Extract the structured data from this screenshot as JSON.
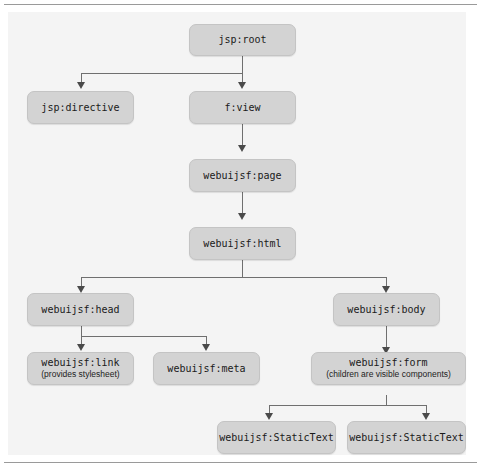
{
  "figure": {
    "kind": "component-tree-diagram",
    "panel_background": "#f4f4f4",
    "node_fill": "#d3d3d3",
    "node_border": "#c4c4c4",
    "connector_color": "#6f6f6f",
    "arrow_color": "#4a4a4a"
  },
  "nodes": {
    "root": {
      "label": "jsp:root"
    },
    "directive": {
      "label": "jsp:directive"
    },
    "view": {
      "label": "f:view"
    },
    "page": {
      "label": "webuijsf:page"
    },
    "html": {
      "label": "webuijsf:html"
    },
    "head": {
      "label": "webuijsf:head"
    },
    "body": {
      "label": "webuijsf:body"
    },
    "link": {
      "label": "webuijsf:link",
      "sublabel": "(provides stylesheet)"
    },
    "meta": {
      "label": "webuijsf:meta"
    },
    "form": {
      "label": "webuijsf:form",
      "sublabel": "(children are visible components)"
    },
    "statictext1": {
      "label": "webuijsf:StaticText"
    },
    "statictext2": {
      "label": "webuijsf:StaticText"
    }
  },
  "edges": [
    {
      "from": "jsp:root",
      "to": "jsp:directive"
    },
    {
      "from": "jsp:root",
      "to": "f:view"
    },
    {
      "from": "f:view",
      "to": "webuijsf:page"
    },
    {
      "from": "webuijsf:page",
      "to": "webuijsf:html"
    },
    {
      "from": "webuijsf:html",
      "to": "webuijsf:head"
    },
    {
      "from": "webuijsf:html",
      "to": "webuijsf:body"
    },
    {
      "from": "webuijsf:head",
      "to": "webuijsf:link"
    },
    {
      "from": "webuijsf:head",
      "to": "webuijsf:meta"
    },
    {
      "from": "webuijsf:body",
      "to": "webuijsf:form"
    },
    {
      "from": "webuijsf:form",
      "to": "webuijsf:StaticText"
    },
    {
      "from": "webuijsf:form",
      "to": "webuijsf:StaticText"
    }
  ]
}
